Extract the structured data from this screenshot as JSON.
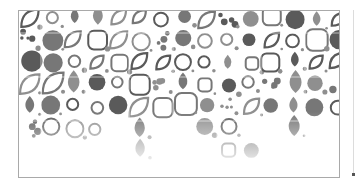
{
  "image": {
    "description": "Decorative grayscale pattern of circles, droplets and leaf shapes inside a thin rectangular frame, fading toward the bottom",
    "colors": {
      "fill_dark": "#5a5a5a",
      "fill_mid": "#777777",
      "fill_light": "#8f8f8f",
      "frame": "#a9a9a9",
      "background": "#ffffff"
    },
    "pattern": {
      "cell": 22,
      "columns": 15,
      "rows": 8,
      "shapes": [
        "circle",
        "drop",
        "leaf",
        "ring",
        "dot-cluster",
        "rounded-square"
      ],
      "fade_start_row": 5
    }
  }
}
